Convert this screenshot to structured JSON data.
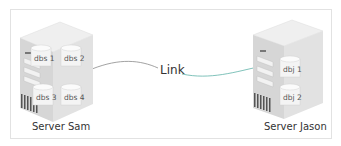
{
  "diagram": {
    "link": {
      "label": "Link",
      "colors": [
        "#8a8a8a",
        "#5fb3a8"
      ]
    },
    "servers": [
      {
        "name": "Server Sam",
        "databases": [
          "dbs 1",
          "dbs 2",
          "dbs 3",
          "dbs 4"
        ]
      },
      {
        "name": "Server Jason",
        "databases": [
          "dbj 1",
          "dbj 2"
        ]
      }
    ],
    "colors": {
      "frame": "#e2e2e2",
      "server_top": "#ececec",
      "server_front": "#d9d9d9",
      "server_side": "#cfcfcf"
    }
  }
}
